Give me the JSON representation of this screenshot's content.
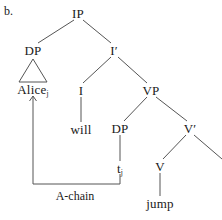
{
  "figure": {
    "item_label": "b.",
    "caption": "A-chain"
  },
  "tree": {
    "nodes": [
      {
        "id": "ip",
        "text": "IP",
        "sub": "",
        "x": 78,
        "y": 13
      },
      {
        "id": "dp-subj",
        "text": "DP",
        "sub": "",
        "x": 33,
        "y": 50
      },
      {
        "id": "ibar",
        "text": "I′",
        "sub": "",
        "x": 114,
        "y": 50
      },
      {
        "id": "alice",
        "text": "Alice",
        "sub": "j",
        "x": 33,
        "y": 89
      },
      {
        "id": "i",
        "text": "I",
        "sub": "",
        "x": 81,
        "y": 90
      },
      {
        "id": "vp",
        "text": "VP",
        "sub": "",
        "x": 151,
        "y": 90
      },
      {
        "id": "will",
        "text": "will",
        "sub": "",
        "x": 81,
        "y": 129
      },
      {
        "id": "dp-trace",
        "text": "DP",
        "sub": "",
        "x": 120,
        "y": 128
      },
      {
        "id": "vbar",
        "text": "V′",
        "sub": "",
        "x": 190,
        "y": 128
      },
      {
        "id": "trace",
        "text": "t",
        "sub": "j",
        "x": 120,
        "y": 168
      },
      {
        "id": "v",
        "text": "V",
        "sub": "",
        "x": 160,
        "y": 166
      },
      {
        "id": "jump",
        "text": "jump",
        "sub": "",
        "x": 160,
        "y": 203
      }
    ],
    "branches": [
      {
        "name": "ip-to-dp",
        "x1": 74,
        "y1": 20,
        "x2": 38,
        "y2": 43
      },
      {
        "name": "ip-to-ibar",
        "x1": 83,
        "y1": 20,
        "x2": 111,
        "y2": 43
      },
      {
        "name": "ibar-to-i",
        "x1": 111,
        "y1": 57,
        "x2": 83,
        "y2": 83
      },
      {
        "name": "ibar-to-vp",
        "x1": 118,
        "y1": 57,
        "x2": 147,
        "y2": 83
      },
      {
        "name": "i-to-will",
        "x1": 81,
        "y1": 97,
        "x2": 81,
        "y2": 122
      },
      {
        "name": "vp-to-dp",
        "x1": 147,
        "y1": 97,
        "x2": 124,
        "y2": 121
      },
      {
        "name": "vp-to-vbar",
        "x1": 156,
        "y1": 97,
        "x2": 187,
        "y2": 121
      },
      {
        "name": "dp-to-trace",
        "x1": 120,
        "y1": 135,
        "x2": 120,
        "y2": 161
      },
      {
        "name": "vbar-to-v",
        "x1": 186,
        "y1": 135,
        "x2": 163,
        "y2": 159
      },
      {
        "name": "vbar-to-right",
        "x1": 194,
        "y1": 135,
        "x2": 222,
        "y2": 159
      },
      {
        "name": "v-to-jump",
        "x1": 160,
        "y1": 173,
        "x2": 160,
        "y2": 196
      }
    ],
    "triangle": {
      "name": "dp-triangle",
      "apex_x": 33,
      "apex_y": 59,
      "left_x": 19,
      "right_x": 47,
      "base_y": 82
    },
    "chain_arrow": {
      "name": "a-chain-arrow",
      "start_x": 120,
      "start_y": 174,
      "corner1_x": 120,
      "corner1_y": 184,
      "corner2_x": 33,
      "corner2_y": 184,
      "end_x": 33,
      "end_y": 96,
      "label_x": 75,
      "label_y": 196
    }
  },
  "colors": {
    "line": "#555555",
    "text": "#1a1a1a",
    "background": "#ffffff"
  }
}
